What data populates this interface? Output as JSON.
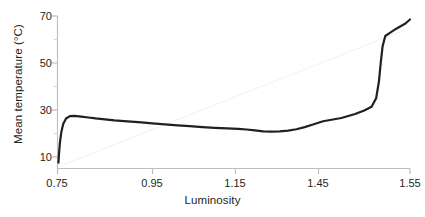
{
  "chart_data": {
    "type": "line",
    "title": "",
    "xlabel": "Luminosity",
    "ylabel": "Mean temperature (°C)",
    "xlim": [
      0.75,
      1.55
    ],
    "ylim": [
      6,
      72
    ],
    "xticks": [
      0.75,
      0.95,
      1.15,
      1.45,
      1.55
    ],
    "xtick_labels": [
      "0.75",
      "0.95",
      "1.15",
      "1.45",
      "1.55"
    ],
    "yticks": [
      10,
      30,
      50,
      70
    ],
    "ytick_labels": [
      "10",
      "30",
      "50",
      "70"
    ],
    "yminor_ticks": [
      20,
      40,
      60
    ],
    "grid": false,
    "legend": null,
    "series": [
      {
        "name": "Mean temperature",
        "color": "#231f20",
        "style": "solid",
        "width": 2.2,
        "x": [
          0.752,
          0.753,
          0.755,
          0.758,
          0.762,
          0.768,
          0.776,
          0.786,
          0.8,
          0.815,
          0.83,
          0.85,
          0.87,
          0.89,
          0.92,
          0.95,
          0.98,
          1.01,
          1.04,
          1.07,
          1.1,
          1.13,
          1.16,
          1.19,
          1.22,
          1.25,
          1.28,
          1.31,
          1.34,
          1.37,
          1.4,
          1.43,
          1.455,
          1.475,
          1.49,
          1.5,
          1.508,
          1.513,
          1.516,
          1.518,
          1.52,
          1.523,
          1.528,
          1.535,
          1.545,
          1.55
        ],
        "y": [
          7.6,
          11.0,
          16.0,
          20.5,
          24.0,
          26.4,
          27.4,
          27.5,
          27.2,
          26.8,
          26.4,
          26.0,
          25.6,
          25.3,
          24.8,
          24.3,
          23.9,
          23.5,
          23.1,
          22.7,
          22.4,
          22.2,
          22.0,
          21.7,
          21.3,
          20.9,
          20.8,
          20.9,
          21.2,
          21.8,
          22.7,
          23.8,
          25.2,
          26.6,
          28.3,
          29.8,
          31.4,
          35.0,
          42.0,
          50.0,
          57.0,
          61.5,
          62.8,
          64.6,
          66.8,
          68.5
        ]
      },
      {
        "name": "reference-line",
        "color": "#f1f1f1",
        "style": "solid",
        "width": 1.0,
        "x": [
          0.76,
          1.55
        ],
        "y": [
          6.5,
          65.0
        ]
      }
    ],
    "axis_color": "#bfbfbf",
    "text_color": "#231f20"
  }
}
